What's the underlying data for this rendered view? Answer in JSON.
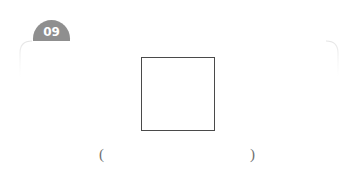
{
  "page": {
    "background_color": "#ffffff",
    "width": 353,
    "height": 176
  },
  "header": {
    "ghost_text": "",
    "faint_artifact_color": "#fdfdfd"
  },
  "badge": {
    "number": "09",
    "shape": "semicircle-tab",
    "fill_color": "#8f8f8f",
    "text_color": "#ffffff"
  },
  "panel": {
    "outline_color": "#e8e8e8",
    "shape": "rounded-rectangle",
    "corner_radius": 14
  },
  "answer_box": {
    "value": "",
    "placeholder": "",
    "border_color": "#4a4a4a",
    "fill_color": "#ffffff"
  },
  "answer_blank": {
    "open_paren": "(",
    "close_paren": ")",
    "value": "",
    "text_color": "#6f6f6f"
  }
}
